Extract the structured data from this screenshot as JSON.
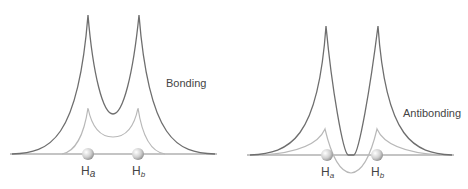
{
  "figure": {
    "panels": [
      {
        "id": "bonding",
        "label": "Bonding",
        "atom_a": {
          "main": "H",
          "sub": "a"
        },
        "atom_b": {
          "main": "H",
          "sub": "b"
        }
      },
      {
        "id": "antibonding",
        "label": "Antibonding",
        "atom_a": {
          "main": "H",
          "sub": "a"
        },
        "atom_b": {
          "main": "H",
          "sub": "b"
        }
      }
    ],
    "colors": {
      "probability_curve": "#6e6e6e",
      "wavefunction_curve": "#b8b8b8",
      "axis": "#8a8a8a",
      "nucleus": "#d0d0d0",
      "text": "#444444"
    }
  }
}
